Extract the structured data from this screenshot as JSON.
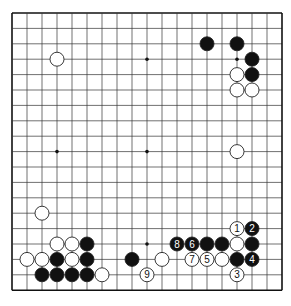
{
  "board": {
    "size": 19,
    "origin_x": 12,
    "origin_y": 13,
    "spacing_x": 15,
    "spacing_y": 15.4,
    "stone_radius": 7,
    "colors": {
      "line": "#333333",
      "border": "#111111",
      "black": "#111111",
      "white": "#ffffff",
      "star": "#111111"
    },
    "star_points": [
      [
        3,
        3
      ],
      [
        9,
        3
      ],
      [
        15,
        3
      ],
      [
        3,
        9
      ],
      [
        9,
        9
      ],
      [
        15,
        9
      ],
      [
        3,
        15
      ],
      [
        9,
        15
      ],
      [
        15,
        15
      ]
    ]
  },
  "stones": [
    {
      "c": 3,
      "r": 3,
      "color": "white"
    },
    {
      "c": 13,
      "r": 2,
      "color": "black"
    },
    {
      "c": 15,
      "r": 2,
      "color": "black"
    },
    {
      "c": 16,
      "r": 3,
      "color": "black"
    },
    {
      "c": 16,
      "r": 4,
      "color": "black"
    },
    {
      "c": 15,
      "r": 4,
      "color": "white"
    },
    {
      "c": 15,
      "r": 5,
      "color": "white"
    },
    {
      "c": 16,
      "r": 5,
      "color": "white"
    },
    {
      "c": 15,
      "r": 9,
      "color": "white"
    },
    {
      "c": 2,
      "r": 13,
      "color": "white"
    },
    {
      "c": 3,
      "r": 15,
      "color": "white"
    },
    {
      "c": 4,
      "r": 15,
      "color": "white"
    },
    {
      "c": 5,
      "r": 15,
      "color": "black"
    },
    {
      "c": 1,
      "r": 16,
      "color": "white"
    },
    {
      "c": 2,
      "r": 16,
      "color": "white"
    },
    {
      "c": 3,
      "r": 16,
      "color": "black"
    },
    {
      "c": 4,
      "r": 16,
      "color": "white"
    },
    {
      "c": 5,
      "r": 16,
      "color": "black"
    },
    {
      "c": 2,
      "r": 17,
      "color": "black"
    },
    {
      "c": 3,
      "r": 17,
      "color": "black"
    },
    {
      "c": 4,
      "r": 17,
      "color": "black"
    },
    {
      "c": 5,
      "r": 17,
      "color": "black"
    },
    {
      "c": 6,
      "r": 17,
      "color": "white"
    },
    {
      "c": 8,
      "r": 16,
      "color": "black"
    },
    {
      "c": 10,
      "r": 16,
      "color": "white"
    },
    {
      "c": 13,
      "r": 15,
      "color": "black"
    },
    {
      "c": 14,
      "r": 15,
      "color": "black"
    },
    {
      "c": 15,
      "r": 15,
      "color": "white"
    },
    {
      "c": 16,
      "r": 15,
      "color": "black"
    },
    {
      "c": 14,
      "r": 16,
      "color": "white"
    },
    {
      "c": 15,
      "r": 16,
      "color": "black"
    },
    {
      "c": 15,
      "r": 14,
      "color": "white",
      "label": "1"
    },
    {
      "c": 16,
      "r": 14,
      "color": "black",
      "label": "2"
    },
    {
      "c": 15,
      "r": 17,
      "color": "white",
      "label": "3"
    },
    {
      "c": 16,
      "r": 16,
      "color": "black",
      "label": "4"
    },
    {
      "c": 13,
      "r": 16,
      "color": "white",
      "label": "5"
    },
    {
      "c": 12,
      "r": 15,
      "color": "black",
      "label": "6"
    },
    {
      "c": 12,
      "r": 16,
      "color": "white",
      "label": "7"
    },
    {
      "c": 11,
      "r": 15,
      "color": "black",
      "label": "8"
    },
    {
      "c": 9,
      "r": 17,
      "color": "white",
      "label": "9"
    }
  ]
}
